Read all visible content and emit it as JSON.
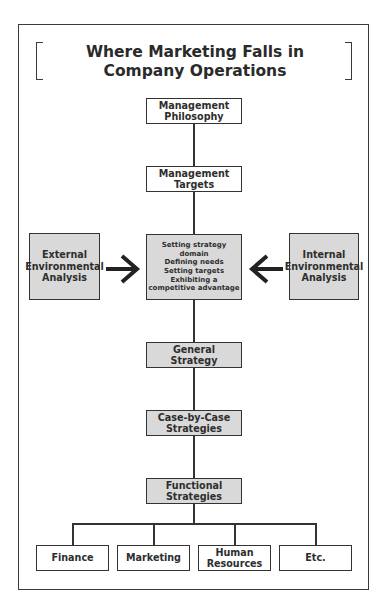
{
  "title": {
    "line1": "Where Marketing Falls in",
    "line2": "Company Operations"
  },
  "nodes": {
    "management_philosophy": {
      "line1": "Management",
      "line2": "Philosophy"
    },
    "management_targets": {
      "line1": "Management",
      "line2": "Targets"
    },
    "external_analysis": {
      "line1": "External",
      "line2": "Environmental",
      "line3": "Analysis"
    },
    "internal_analysis": {
      "line1": "Internal",
      "line2": "Environmental",
      "line3": "Analysis"
    },
    "core_activities": {
      "line1": "Setting strategy",
      "line2": "domain",
      "line3": "Defining needs",
      "line4": "Setting targets",
      "line5": "Exhibiting a",
      "line6": "competitive advantage"
    },
    "general_strategy": {
      "line1": "General",
      "line2": "Strategy"
    },
    "case_by_case": {
      "line1": "Case-by-Case",
      "line2": "Strategies"
    },
    "functional_strategies": {
      "line1": "Functional",
      "line2": "Strategies"
    },
    "functions": [
      {
        "line1": "Finance",
        "line2": ""
      },
      {
        "line1": "Marketing",
        "line2": ""
      },
      {
        "line1": "Human",
        "line2": "Resources"
      },
      {
        "line1": "Etc.",
        "line2": ""
      }
    ]
  },
  "colors": {
    "box_fill_highlight": "#d9d9d9",
    "stroke": "#333333",
    "background": "#ffffff"
  }
}
